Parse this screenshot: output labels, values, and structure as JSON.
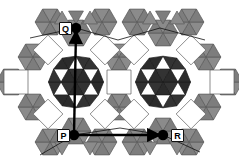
{
  "figure": {
    "background_color": "#ffffff",
    "width": 239,
    "height": 166
  },
  "palette": {
    "tile_light": "#ffffff",
    "tile_mid": "#8b8b8b",
    "tile_mid_alt": "#7d7d7d",
    "tile_dark": "#333333",
    "tile_dark_alt": "#2b2b2b",
    "edge": "#5a5a5a",
    "edge_dark": "#1a1a1a",
    "vector": "#000000",
    "label_text": "#000000",
    "label_box": "#ffffff"
  },
  "points": [
    {
      "id": "P",
      "label": "P",
      "x": 74,
      "y": 135,
      "label_x": 57,
      "label_y": 129
    },
    {
      "id": "Q",
      "label": "Q",
      "x": 76,
      "y": 28,
      "label_x": 59,
      "label_y": 22
    },
    {
      "id": "R",
      "label": "R",
      "x": 163,
      "y": 135,
      "label_x": 171,
      "label_y": 129
    }
  ],
  "vectors": [
    {
      "id": "PQ",
      "from": "P",
      "to": "Q",
      "x1": 74,
      "y1": 135,
      "x2": 76,
      "y2": 31,
      "label": "PQ"
    },
    {
      "id": "PR",
      "from": "P",
      "to": "R",
      "x1": 74,
      "y1": 135,
      "x2": 160,
      "y2": 135,
      "label": "PR"
    }
  ],
  "thin_lines": [
    {
      "x1": 40,
      "y1": 155,
      "x2": 74,
      "y2": 135
    },
    {
      "x1": 74,
      "y1": 135,
      "x2": 120,
      "y2": 128
    },
    {
      "x1": 120,
      "y1": 128,
      "x2": 163,
      "y2": 135
    },
    {
      "x1": 163,
      "y1": 135,
      "x2": 200,
      "y2": 152
    },
    {
      "x1": 30,
      "y1": 38,
      "x2": 76,
      "y2": 28
    },
    {
      "x1": 76,
      "y1": 28,
      "x2": 118,
      "y2": 40
    },
    {
      "x1": 118,
      "y1": 40,
      "x2": 160,
      "y2": 28
    },
    {
      "x1": 160,
      "y1": 28,
      "x2": 205,
      "y2": 40
    }
  ],
  "legend": {
    "note": ""
  }
}
